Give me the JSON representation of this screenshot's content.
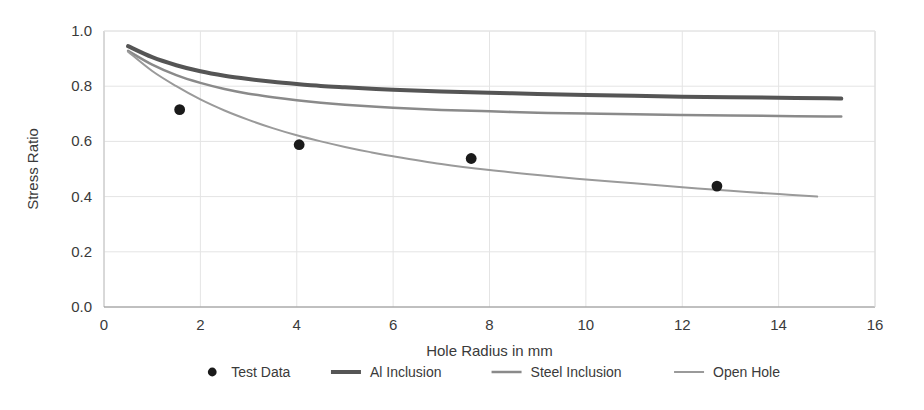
{
  "chart_data": {
    "type": "line",
    "title": "",
    "xlabel": "Hole Radius in mm",
    "ylabel": "Stress Ratio",
    "xlim": [
      0,
      16
    ],
    "ylim": [
      0.0,
      1.0
    ],
    "xticks": [
      0,
      2,
      4,
      6,
      8,
      10,
      12,
      14,
      16
    ],
    "xtick_labels": [
      "0",
      "2",
      "4",
      "6",
      "8",
      "10",
      "12",
      "14",
      "16"
    ],
    "yticks": [
      0.0,
      0.2,
      0.4,
      0.6,
      0.8,
      1.0
    ],
    "ytick_labels": [
      "0.0",
      "0.2",
      "0.4",
      "0.6",
      "0.8",
      "1.0"
    ],
    "grid": true,
    "grid_color": "#e4e4e4",
    "legend_position": "bottom",
    "scatter_series": [
      {
        "name": "Test Data",
        "marker": "circle",
        "color": "#1a1a1a",
        "points": [
          {
            "x": 1.57,
            "y": 0.715
          },
          {
            "x": 4.05,
            "y": 0.588
          },
          {
            "x": 7.62,
            "y": 0.538
          },
          {
            "x": 12.72,
            "y": 0.438
          }
        ]
      }
    ],
    "series": [
      {
        "name": "Al Inclusion",
        "color": "#555555",
        "width": 4,
        "x": [
          0.5,
          1.0,
          1.5,
          2.0,
          2.5,
          3.0,
          3.5,
          4.0,
          4.5,
          5.0,
          6.0,
          7.0,
          8.0,
          9.0,
          10.0,
          11.0,
          12.0,
          13.0,
          14.0,
          15.0,
          15.3
        ],
        "y": [
          0.945,
          0.905,
          0.876,
          0.854,
          0.838,
          0.826,
          0.816,
          0.808,
          0.801,
          0.796,
          0.787,
          0.781,
          0.776,
          0.772,
          0.768,
          0.765,
          0.762,
          0.76,
          0.758,
          0.756,
          0.755
        ]
      },
      {
        "name": "Steel Inclusion",
        "color": "#8a8a8a",
        "width": 2.5,
        "x": [
          0.5,
          1.0,
          1.5,
          2.0,
          2.5,
          3.0,
          3.5,
          4.0,
          4.5,
          5.0,
          6.0,
          7.0,
          8.0,
          9.0,
          10.0,
          11.0,
          12.0,
          13.0,
          14.0,
          15.0,
          15.3
        ],
        "y": [
          0.928,
          0.878,
          0.84,
          0.812,
          0.79,
          0.773,
          0.76,
          0.749,
          0.74,
          0.733,
          0.722,
          0.714,
          0.709,
          0.704,
          0.701,
          0.698,
          0.696,
          0.694,
          0.692,
          0.69,
          0.69
        ]
      },
      {
        "name": "Open Hole",
        "color": "#9a9a9a",
        "width": 2,
        "x": [
          0.5,
          1.0,
          1.5,
          2.0,
          2.5,
          3.0,
          3.5,
          4.0,
          4.5,
          5.0,
          5.5,
          6.0,
          7.0,
          8.0,
          9.0,
          10.0,
          11.0,
          12.0,
          13.0,
          14.0,
          14.8
        ],
        "y": [
          0.925,
          0.855,
          0.8,
          0.752,
          0.712,
          0.678,
          0.648,
          0.622,
          0.6,
          0.58,
          0.562,
          0.546,
          0.518,
          0.496,
          0.478,
          0.462,
          0.448,
          0.434,
          0.421,
          0.409,
          0.4
        ]
      }
    ],
    "legend": [
      {
        "label": "Test Data",
        "marker": "circle",
        "color": "#1a1a1a"
      },
      {
        "label": "Al Inclusion",
        "marker": "line",
        "color": "#555555",
        "width": 4
      },
      {
        "label": "Steel Inclusion",
        "marker": "line",
        "color": "#8a8a8a",
        "width": 2.5
      },
      {
        "label": "Open Hole",
        "marker": "line",
        "color": "#9a9a9a",
        "width": 2
      }
    ]
  }
}
